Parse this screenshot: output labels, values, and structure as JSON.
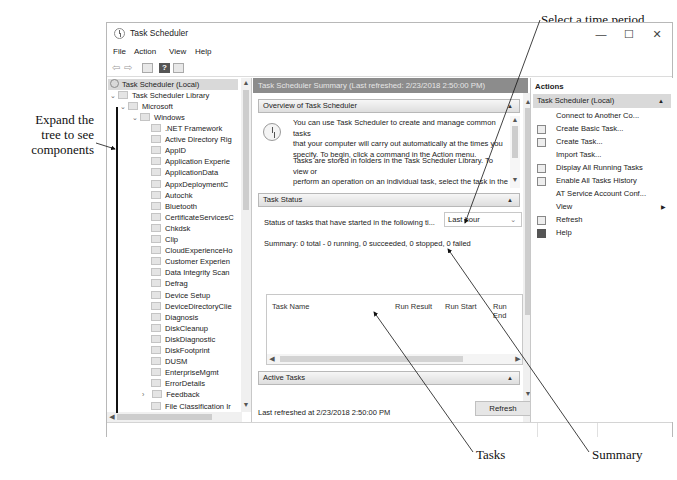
{
  "annotations": {
    "expand_tree": [
      "Expand the",
      "tree to see",
      "components"
    ],
    "select_time": "Select a time period",
    "tasks": "Tasks",
    "summary": "Summary"
  },
  "window": {
    "title": "Task Scheduler",
    "controls": {
      "minimize": "—",
      "maximize": "☐",
      "close": "✕"
    }
  },
  "menu": [
    "File",
    "Action",
    "View",
    "Help"
  ],
  "toolbar": {
    "icons": [
      "back-arrow-icon",
      "forward-arrow-icon",
      "show-hide-console-tree-icon",
      "help-icon",
      "show-hide-action-pane-icon"
    ],
    "back": "⇦",
    "forward": "⇨",
    "help": "?"
  },
  "tree": {
    "root": "Task Scheduler (Local)",
    "library": "Task Scheduler Library",
    "microsoft": "Microsoft",
    "windows": "Windows",
    "items": [
      ".NET Framework",
      "Active Directory Rig",
      "AppID",
      "Application Experie",
      "ApplicationData",
      "AppxDeploymentC",
      "Autochk",
      "Bluetooth",
      "CertificateServicesC",
      "Chkdsk",
      "Clip",
      "CloudExperienceHo",
      "Customer Experien",
      "Data Integrity Scan",
      "Defrag",
      "Device Setup",
      "DeviceDirectoryClie",
      "Diagnosis",
      "DiskCleanup",
      "DiskDiagnostic",
      "DiskFootprint",
      "DUSM",
      "EnterpriseMgmt",
      "ErrorDetails",
      "Feedback",
      "File Classification Ir"
    ]
  },
  "center": {
    "header": "Task Scheduler Summary (Last refreshed: 2/23/2018 2:50:00 PM)",
    "overview_title": "Overview of Task Scheduler",
    "overview_p1": [
      "You can use Task Scheduler to create and manage common tasks",
      "that your computer will carry out automatically at the times you",
      "specify. To begin, click a command in the Action menu."
    ],
    "overview_p2": [
      "Tasks are stored in folders in the Task Scheduler Library. To view or",
      "perform an operation on an individual task, select the task in the",
      "Task Scheduler Library and click on a command in the Action"
    ],
    "task_status_title": "Task Status",
    "status_label": "Status of tasks that have started in the following ti...",
    "time_period": "Last hour",
    "summary": "Summary: 0 total - 0 running, 0 succeeded, 0 stopped, 0 failed",
    "table_columns": [
      "Task Name",
      "Run Result",
      "Run Start",
      "Run End"
    ],
    "active_tasks_title": "Active Tasks",
    "last_refreshed": "Last refreshed at 2/23/2018 2:50:00 PM",
    "refresh_button": "Refresh"
  },
  "actions": {
    "title": "Actions",
    "group": "Task Scheduler (Local)",
    "items": [
      {
        "label": "Connect to Another Co...",
        "icon": ""
      },
      {
        "label": "Create Basic Task...",
        "icon": "create-basic-task-icon"
      },
      {
        "label": "Create Task...",
        "icon": "create-task-icon"
      },
      {
        "label": "Import Task...",
        "icon": ""
      },
      {
        "label": "Display All Running Tasks",
        "icon": "display-running-tasks-icon"
      },
      {
        "label": "Enable All Tasks History",
        "icon": "enable-history-icon"
      },
      {
        "label": "AT Service Account Conf...",
        "icon": ""
      },
      {
        "label": "View",
        "icon": "",
        "submenu": "▶"
      },
      {
        "label": "Refresh",
        "icon": "refresh-icon"
      },
      {
        "label": "Help",
        "icon": "help-icon"
      }
    ]
  }
}
